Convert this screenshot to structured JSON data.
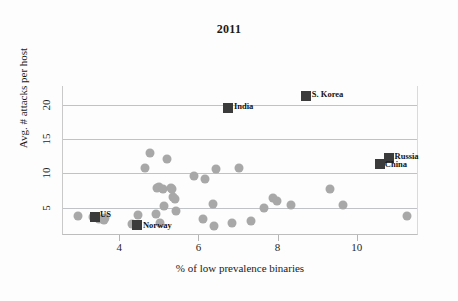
{
  "chart_data": {
    "type": "scatter",
    "title": "2011",
    "xlabel": "% of low prevalence binaries",
    "ylabel": "Avg. # attacks per host",
    "xlim": [
      2.55,
      11.55
    ],
    "ylim": [
      1.0,
      22.7
    ],
    "xticks": [
      4,
      6,
      8,
      10
    ],
    "yticks": [
      5,
      10,
      15,
      20
    ],
    "grid": "horizontal",
    "legend": "none",
    "series": [
      {
        "name": "countries",
        "marker": "circle",
        "color": "#a8a8a8",
        "points": [
          {
            "x": 2.93,
            "y": 3.7
          },
          {
            "x": 3.31,
            "y": 3.6
          },
          {
            "x": 3.45,
            "y": 3.4
          },
          {
            "x": 3.58,
            "y": 3.2
          },
          {
            "x": 3.62,
            "y": 3.5
          },
          {
            "x": 4.29,
            "y": 2.6
          },
          {
            "x": 4.45,
            "y": 3.9
          },
          {
            "x": 4.62,
            "y": 10.8
          },
          {
            "x": 4.74,
            "y": 12.9
          },
          {
            "x": 4.9,
            "y": 4.0
          },
          {
            "x": 4.93,
            "y": 7.9
          },
          {
            "x": 4.97,
            "y": 8.0
          },
          {
            "x": 5.0,
            "y": 2.8
          },
          {
            "x": 5.08,
            "y": 7.7
          },
          {
            "x": 5.1,
            "y": 5.2
          },
          {
            "x": 5.19,
            "y": 12.0
          },
          {
            "x": 5.27,
            "y": 7.9
          },
          {
            "x": 5.3,
            "y": 7.7
          },
          {
            "x": 5.34,
            "y": 6.6
          },
          {
            "x": 5.38,
            "y": 6.2
          },
          {
            "x": 5.4,
            "y": 4.5
          },
          {
            "x": 5.85,
            "y": 9.6
          },
          {
            "x": 6.08,
            "y": 3.3
          },
          {
            "x": 6.13,
            "y": 9.2
          },
          {
            "x": 6.33,
            "y": 5.5
          },
          {
            "x": 6.37,
            "y": 2.3
          },
          {
            "x": 6.42,
            "y": 10.6
          },
          {
            "x": 6.83,
            "y": 2.8
          },
          {
            "x": 7.0,
            "y": 10.8
          },
          {
            "x": 7.3,
            "y": 3.0
          },
          {
            "x": 7.62,
            "y": 4.9
          },
          {
            "x": 7.86,
            "y": 6.4
          },
          {
            "x": 7.95,
            "y": 6.0
          },
          {
            "x": 8.32,
            "y": 5.4
          },
          {
            "x": 9.3,
            "y": 7.7
          },
          {
            "x": 9.63,
            "y": 5.3
          },
          {
            "x": 11.25,
            "y": 3.7
          }
        ]
      },
      {
        "name": "highlighted-countries",
        "marker": "square",
        "color": "#3b3b3b",
        "points": [
          {
            "x": 3.36,
            "y": 3.6,
            "label": "US",
            "label_dx": 5,
            "label_dy": -3
          },
          {
            "x": 4.42,
            "y": 2.4,
            "label": "Norway",
            "label_dx": 6,
            "label_dy": 0
          },
          {
            "x": 6.72,
            "y": 19.5,
            "label": "India",
            "label_dx": 6,
            "label_dy": -2
          },
          {
            "x": 8.69,
            "y": 21.2,
            "label": "S. Korea",
            "label_dx": 6,
            "label_dy": -2
          },
          {
            "x": 10.78,
            "y": 12.2,
            "label": "Russia",
            "label_dx": 6,
            "label_dy": -2
          },
          {
            "x": 10.56,
            "y": 11.3,
            "label": "China",
            "label_dx": 5,
            "label_dy": 0
          }
        ]
      }
    ]
  }
}
